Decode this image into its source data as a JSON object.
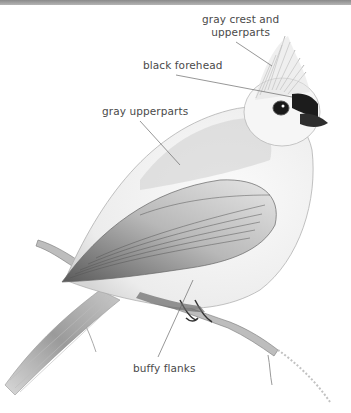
{
  "figure": {
    "colors": {
      "background": "#ffffff",
      "top_band": "#9a9a9a",
      "label_text": "#4a4a4a",
      "leader_line": "#6a6a6a"
    },
    "labels": [
      {
        "id": "crest",
        "lines": [
          "gray crest and",
          "upperparts"
        ],
        "x": 202,
        "y": 13,
        "target": [
          272,
          66
        ]
      },
      {
        "id": "forehead",
        "lines": [
          "black forehead"
        ],
        "x": 143,
        "y": 59,
        "target": [
          292,
          97
        ]
      },
      {
        "id": "upperparts",
        "lines": [
          "gray upperparts"
        ],
        "x": 102,
        "y": 105,
        "target": [
          180,
          165
        ]
      },
      {
        "id": "flanks",
        "lines": [
          "buffy flanks"
        ],
        "x": 133,
        "y": 362,
        "target": [
          193,
          280
        ]
      }
    ]
  }
}
